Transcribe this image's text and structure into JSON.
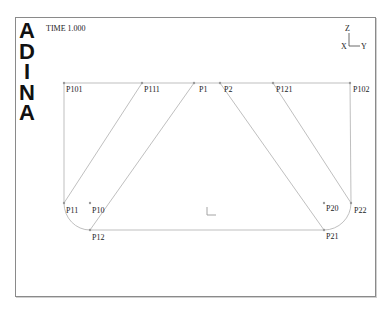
{
  "logo": {
    "letters": [
      "A",
      "D",
      "I",
      "N",
      "A"
    ]
  },
  "time_label": "TIME 1.000",
  "triad": {
    "z": "Z",
    "x": "X",
    "y": "Y"
  },
  "points": [
    {
      "name": "P101",
      "x": 64,
      "y": 83,
      "lx": 66,
      "ly": 85
    },
    {
      "name": "P111",
      "x": 142,
      "y": 83,
      "lx": 144,
      "ly": 85
    },
    {
      "name": "P1",
      "x": 194,
      "y": 83,
      "lx": 199,
      "ly": 85
    },
    {
      "name": "P2",
      "x": 220,
      "y": 83,
      "lx": 224,
      "ly": 85
    },
    {
      "name": "P121",
      "x": 273,
      "y": 83,
      "lx": 276,
      "ly": 85
    },
    {
      "name": "P102",
      "x": 350,
      "y": 83,
      "lx": 353,
      "ly": 85
    },
    {
      "name": "P11",
      "x": 64,
      "y": 203,
      "lx": 66,
      "ly": 206
    },
    {
      "name": "P10",
      "x": 90,
      "y": 203,
      "lx": 92,
      "ly": 206
    },
    {
      "name": "P12",
      "x": 90,
      "y": 230,
      "lx": 92,
      "ly": 233
    },
    {
      "name": "P20",
      "x": 324,
      "y": 203,
      "lx": 326,
      "ly": 204
    },
    {
      "name": "P22",
      "x": 351,
      "y": 203,
      "lx": 354,
      "ly": 206
    },
    {
      "name": "P21",
      "x": 324,
      "y": 230,
      "lx": 326,
      "ly": 232
    }
  ],
  "colors": {
    "line": "#b8b8b8",
    "frame": "#8a8a8a",
    "text": "#222222",
    "logo": "#111111"
  }
}
